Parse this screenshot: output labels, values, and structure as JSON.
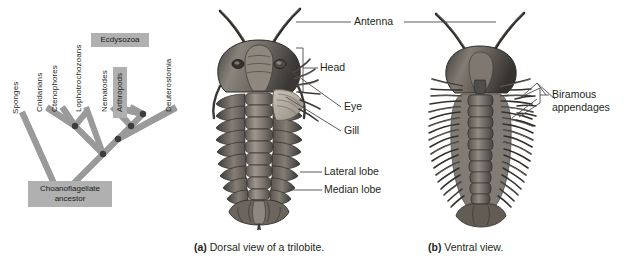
{
  "figure": {
    "background": "#ffffff"
  },
  "colors": {
    "branch": "#9a9a9a",
    "branch_highlight": "#8f8f8f",
    "node": "#3d3d3d",
    "clade_box": "#b0b0b0",
    "text": "#231f20",
    "leader": "#4a4a4a",
    "body_dark": "#4a4745",
    "body_mid": "#6e6a66",
    "body_light": "#a9a49e"
  },
  "tree": {
    "tips": [
      {
        "label": "Sponges"
      },
      {
        "label": "Cnidarians"
      },
      {
        "label": "Ctenophores"
      },
      {
        "label": "Lophotrochozoans"
      },
      {
        "label": "Nematodes"
      },
      {
        "label": "Arthropods"
      },
      {
        "label": "Deuterostomia"
      }
    ],
    "clades": [
      {
        "label": "Ecdysozoa"
      },
      {
        "label": "Arthropods"
      }
    ],
    "root_label": "Choanoflagellate\nancestor",
    "root_label_line1": "Choanoflagellate",
    "root_label_line2": "ancestor",
    "node_count": 5
  },
  "dorsal": {
    "caption_letter": "(a)",
    "caption_text": "Dorsal view of a trilobite.",
    "labels": [
      {
        "name": "antenna",
        "text": "Antenna"
      },
      {
        "name": "head",
        "text": "Head"
      },
      {
        "name": "eye",
        "text": "Eye"
      },
      {
        "name": "gill",
        "text": "Gill"
      },
      {
        "name": "lateral-lobe",
        "text": "Lateral lobe"
      },
      {
        "name": "median-lobe",
        "text": "Median lobe"
      }
    ]
  },
  "ventral": {
    "caption_letter": "(b)",
    "caption_text": "Ventral view.",
    "labels": [
      {
        "name": "biramous-appendages",
        "line1": "Biramous",
        "line2": "appendages"
      }
    ]
  }
}
